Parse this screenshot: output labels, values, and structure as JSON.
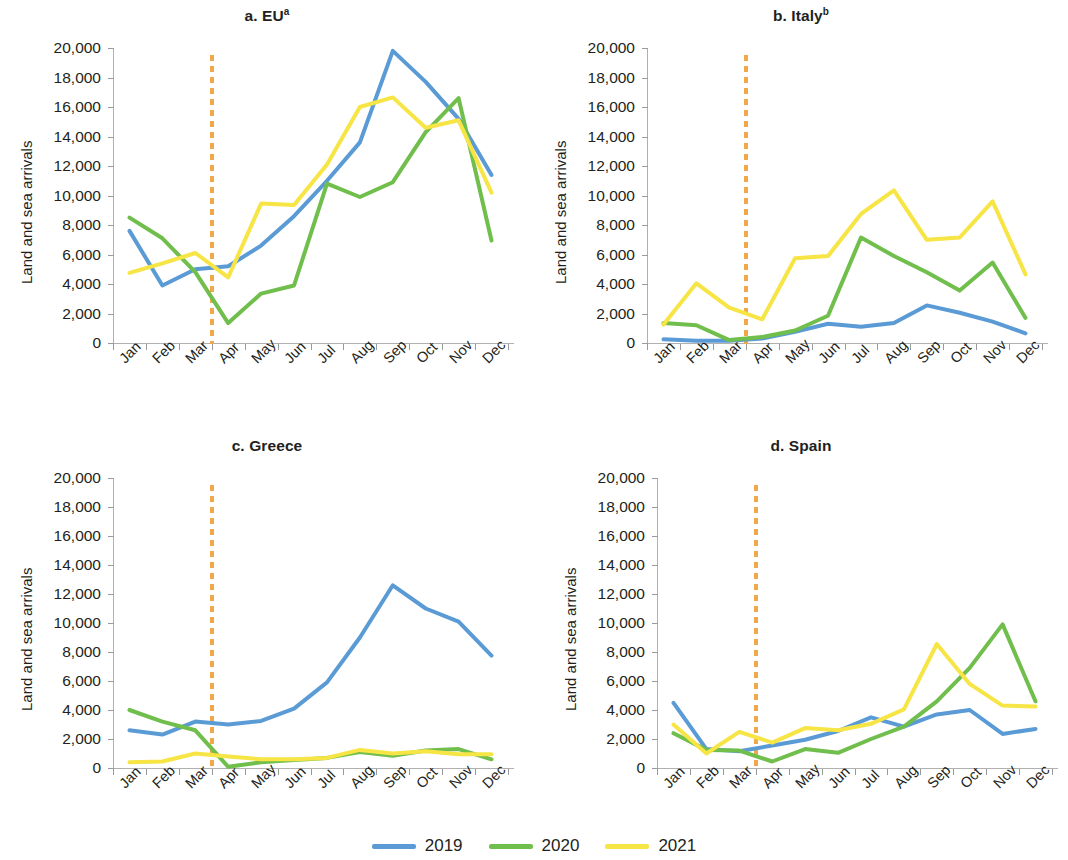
{
  "figure": {
    "y_axis_label": "Land and sea arrivals",
    "y_ticks": [
      "20,000",
      "18,000",
      "16,000",
      "14,000",
      "12,000",
      "10,000",
      "8,000",
      "6,000",
      "4,000",
      "2,000",
      "0"
    ],
    "x_ticks": [
      "Jan",
      "Feb",
      "Mar",
      "Apr",
      "May",
      "Jun",
      "Jul",
      "Aug",
      "Sep",
      "Oct",
      "Nov",
      "Dec"
    ],
    "marker_note": "covid-onset-marker",
    "colors": {
      "series_2019": "#5B9BD5",
      "series_2020": "#70BE4B",
      "series_2021": "#F7E445",
      "marker": "#F0A84B",
      "axis": "#b0b0b0",
      "text": "#231f20"
    }
  },
  "legend": {
    "items": [
      {
        "label": "2019",
        "color": "#5B9BD5"
      },
      {
        "label": "2020",
        "color": "#70BE4B"
      },
      {
        "label": "2021",
        "color": "#F7E445"
      }
    ]
  },
  "panels": [
    {
      "id": "a",
      "title_main": "a. EU",
      "title_sup": "a"
    },
    {
      "id": "b",
      "title_main": "b. Italy",
      "title_sup": "b"
    },
    {
      "id": "c",
      "title_main": "c. Greece",
      "title_sup": ""
    },
    {
      "id": "d",
      "title_main": "d. Spain",
      "title_sup": ""
    }
  ],
  "chart_data": [
    {
      "type": "line",
      "title": "a. EUᵃ",
      "xlabel": "",
      "ylabel": "Land and sea arrivals",
      "categories": [
        "Jan",
        "Feb",
        "Mar",
        "Apr",
        "May",
        "Jun",
        "Jul",
        "Aug",
        "Sep",
        "Oct",
        "Nov",
        "Dec"
      ],
      "ylim": [
        0,
        20000
      ],
      "ytick_step": 2000,
      "grid": false,
      "legend_position": "bottom-center",
      "annotations": [
        {
          "type": "vline",
          "x": "Mar/Apr boundary",
          "style": "dotted",
          "color": "#F0A84B",
          "label": "COVID-19 onset"
        }
      ],
      "series": [
        {
          "name": "2019",
          "color": "#5B9BD5",
          "values": [
            7600,
            3900,
            5000,
            5200,
            6600,
            8600,
            11000,
            13600,
            19800,
            17700,
            15200,
            11400
          ]
        },
        {
          "name": "2020",
          "color": "#70BE4B",
          "values": [
            8500,
            7100,
            4800,
            1350,
            3350,
            3900,
            10800,
            9900,
            10900,
            14300,
            16600,
            6950
          ]
        },
        {
          "name": "2021",
          "color": "#F7E445",
          "values": [
            4750,
            5400,
            6100,
            4450,
            9450,
            9350,
            12100,
            16000,
            16650,
            14600,
            15100,
            10200
          ]
        }
      ]
    },
    {
      "type": "line",
      "title": "b. Italyᵇ",
      "xlabel": "",
      "ylabel": "Land and sea arrivals",
      "categories": [
        "Jan",
        "Feb",
        "Mar",
        "Apr",
        "May",
        "Jun",
        "Jul",
        "Aug",
        "Sep",
        "Oct",
        "Nov",
        "Dec"
      ],
      "ylim": [
        0,
        20000
      ],
      "ytick_step": 2000,
      "grid": false,
      "legend_position": "bottom-center",
      "annotations": [
        {
          "type": "vline",
          "x": "Mar/Apr boundary",
          "style": "dotted",
          "color": "#F0A84B",
          "label": "COVID-19 onset"
        }
      ],
      "series": [
        {
          "name": "2019",
          "color": "#5B9BD5",
          "values": [
            250,
            150,
            150,
            300,
            750,
            1300,
            1100,
            1350,
            2550,
            2050,
            1450,
            650
          ]
        },
        {
          "name": "2020",
          "color": "#70BE4B",
          "values": [
            1350,
            1200,
            200,
            400,
            850,
            1850,
            7150,
            5900,
            4800,
            3550,
            5450,
            1700
          ]
        },
        {
          "name": "2021",
          "color": "#F7E445",
          "values": [
            1250,
            4050,
            2400,
            1600,
            5750,
            5900,
            8750,
            10350,
            7000,
            7150,
            9600,
            4650
          ]
        }
      ]
    },
    {
      "type": "line",
      "title": "c. Greece",
      "xlabel": "",
      "ylabel": "Land and sea arrivals",
      "categories": [
        "Jan",
        "Feb",
        "Mar",
        "Apr",
        "May",
        "Jun",
        "Jul",
        "Aug",
        "Sep",
        "Oct",
        "Nov",
        "Dec"
      ],
      "ylim": [
        0,
        20000
      ],
      "ytick_step": 2000,
      "grid": false,
      "legend_position": "bottom-center",
      "annotations": [
        {
          "type": "vline",
          "x": "Mar/Apr boundary",
          "style": "dotted",
          "color": "#F0A84B",
          "label": "COVID-19 onset"
        }
      ],
      "series": [
        {
          "name": "2019",
          "color": "#5B9BD5",
          "values": [
            2600,
            2300,
            3200,
            3000,
            3250,
            4100,
            5900,
            9000,
            12600,
            11000,
            10100,
            7750
          ]
        },
        {
          "name": "2020",
          "color": "#70BE4B",
          "values": [
            4000,
            3200,
            2600,
            80,
            400,
            550,
            700,
            1100,
            850,
            1200,
            1300,
            600
          ]
        },
        {
          "name": "2021",
          "color": "#F7E445",
          "values": [
            400,
            450,
            1000,
            800,
            600,
            600,
            700,
            1250,
            1000,
            1150,
            950,
            950
          ]
        }
      ]
    },
    {
      "type": "line",
      "title": "d. Spain",
      "xlabel": "",
      "ylabel": "Land and sea arrivals",
      "categories": [
        "Jan",
        "Feb",
        "Mar",
        "Apr",
        "May",
        "Jun",
        "Jul",
        "Aug",
        "Sep",
        "Oct",
        "Nov",
        "Dec"
      ],
      "ylim": [
        0,
        20000
      ],
      "ytick_step": 2000,
      "grid": false,
      "legend_position": "bottom-center",
      "annotations": [
        {
          "type": "vline",
          "x": "Mar/Apr boundary",
          "style": "dotted",
          "color": "#F0A84B",
          "label": "COVID-19 onset"
        }
      ],
      "series": [
        {
          "name": "2019",
          "color": "#5B9BD5",
          "values": [
            4500,
            1300,
            1150,
            1550,
            1950,
            2550,
            3500,
            2850,
            3700,
            4000,
            2350,
            2700
          ]
        },
        {
          "name": "2020",
          "color": "#70BE4B",
          "values": [
            2400,
            1250,
            1200,
            450,
            1300,
            1050,
            2000,
            2850,
            4600,
            6900,
            9900,
            4600
          ]
        },
        {
          "name": "2021",
          "color": "#F7E445",
          "values": [
            3000,
            1000,
            2500,
            1750,
            2750,
            2600,
            3050,
            4050,
            8550,
            5800,
            4300,
            4250
          ]
        }
      ]
    }
  ]
}
